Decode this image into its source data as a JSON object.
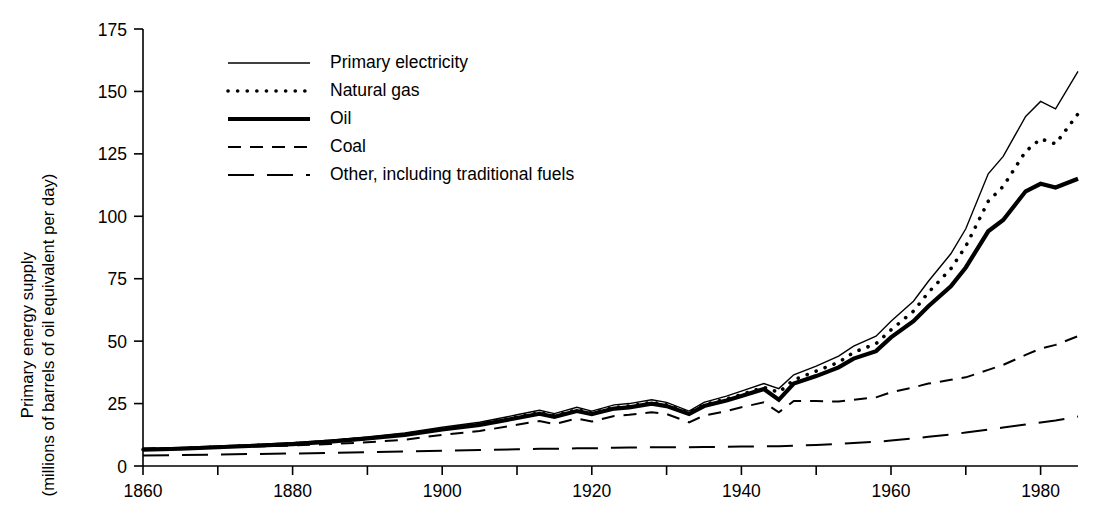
{
  "chart_data": {
    "type": "line",
    "title": "",
    "xlabel": "",
    "ylabel": "Primary energy supply (millions of barrels of oil equivalent per day)",
    "ylabel_line1": "Primary energy supply",
    "ylabel_line2": "(millions of barrels of oil equivalent per day)",
    "xlim": [
      1860,
      1985
    ],
    "ylim": [
      0,
      175
    ],
    "grid": false,
    "legend_position": "upper-left-inside",
    "y_ticks": [
      0,
      25,
      50,
      75,
      100,
      125,
      150,
      175
    ],
    "y_tick_labels": [
      "0",
      "25",
      "50",
      "75",
      "100",
      "125",
      "150",
      "175"
    ],
    "x_ticks": [
      1860,
      1880,
      1900,
      1920,
      1940,
      1960,
      1980
    ],
    "x_tick_labels": [
      "1860",
      "1880",
      "1900",
      "1920",
      "1940",
      "1960",
      "1980"
    ],
    "x_minor_ticks": [
      1870,
      1890,
      1910,
      1930,
      1950,
      1970
    ],
    "x": [
      1860,
      1865,
      1870,
      1875,
      1880,
      1885,
      1890,
      1895,
      1900,
      1905,
      1910,
      1913,
      1915,
      1918,
      1920,
      1923,
      1925,
      1928,
      1930,
      1933,
      1935,
      1938,
      1940,
      1943,
      1945,
      1947,
      1950,
      1953,
      1955,
      1958,
      1960,
      1963,
      1965,
      1968,
      1970,
      1973,
      1975,
      1978,
      1980,
      1982,
      1985
    ],
    "series": [
      {
        "name": "Primary electricity",
        "style": "solid-thin",
        "values": [
          7.0,
          7.4,
          8.0,
          8.6,
          9.3,
          10.3,
          11.6,
          13.2,
          15.5,
          17.5,
          20.5,
          22.3,
          21.0,
          23.5,
          22.0,
          24.5,
          25.0,
          26.5,
          25.5,
          22.0,
          25.5,
          28.0,
          30.0,
          33.0,
          31.0,
          36.5,
          40.0,
          44.0,
          48.0,
          52.0,
          58.0,
          66.0,
          74.0,
          85.0,
          95.0,
          117.0,
          124.0,
          140.0,
          146.0,
          143.0,
          158.0
        ]
      },
      {
        "name": "Natural gas",
        "style": "dotted",
        "values": [
          6.6,
          7.0,
          7.6,
          8.2,
          8.9,
          9.9,
          11.1,
          12.6,
          14.8,
          16.8,
          19.6,
          21.3,
          20.1,
          22.5,
          21.2,
          23.5,
          24.0,
          25.5,
          24.5,
          21.2,
          24.5,
          26.8,
          28.6,
          31.5,
          29.5,
          34.5,
          38.0,
          41.5,
          45.5,
          49.0,
          54.5,
          62.0,
          69.5,
          79.0,
          88.0,
          106.0,
          112.0,
          126.0,
          131.0,
          129.0,
          141.0
        ]
      },
      {
        "name": "Oil",
        "style": "solid-thick",
        "values": [
          6.5,
          6.9,
          7.5,
          8.1,
          8.8,
          9.8,
          11.0,
          12.5,
          14.6,
          16.5,
          19.2,
          20.9,
          19.7,
          22.0,
          20.8,
          23.0,
          23.5,
          25.0,
          24.0,
          20.8,
          24.0,
          26.2,
          28.0,
          30.8,
          26.5,
          33.0,
          36.0,
          39.5,
          43.0,
          46.0,
          51.5,
          58.0,
          64.0,
          72.0,
          79.5,
          94.0,
          98.5,
          110.0,
          113.0,
          111.5,
          115.0
        ]
      },
      {
        "name": "Coal",
        "style": "dashed-short",
        "values": [
          7.0,
          7.2,
          7.5,
          7.8,
          8.2,
          8.8,
          9.5,
          10.5,
          12.5,
          14.0,
          16.5,
          18.0,
          16.8,
          19.0,
          17.8,
          20.0,
          20.5,
          21.5,
          20.8,
          17.5,
          20.2,
          22.0,
          23.5,
          25.5,
          21.5,
          26.0,
          26.0,
          25.8,
          26.5,
          27.5,
          29.5,
          31.5,
          33.0,
          34.5,
          35.5,
          38.5,
          40.5,
          44.5,
          47.0,
          48.5,
          52.0
        ]
      },
      {
        "name": "Other, including traditional fuels",
        "style": "dashed-long",
        "values": [
          4.2,
          4.4,
          4.6,
          4.8,
          5.0,
          5.2,
          5.5,
          5.8,
          6.1,
          6.4,
          6.7,
          6.9,
          6.9,
          7.1,
          7.1,
          7.3,
          7.4,
          7.5,
          7.5,
          7.5,
          7.6,
          7.7,
          7.8,
          7.9,
          7.9,
          8.1,
          8.4,
          8.8,
          9.2,
          9.7,
          10.2,
          11.0,
          11.7,
          12.6,
          13.4,
          14.6,
          15.4,
          16.6,
          17.4,
          18.2,
          19.8
        ]
      }
    ],
    "legend": [
      {
        "label": "Primary electricity",
        "style": "solid-thin"
      },
      {
        "label": "Natural gas",
        "style": "dotted"
      },
      {
        "label": "Oil",
        "style": "solid-thick"
      },
      {
        "label": "Coal",
        "style": "dashed-short"
      },
      {
        "label": "Other, including traditional fuels",
        "style": "dashed-long"
      }
    ]
  }
}
